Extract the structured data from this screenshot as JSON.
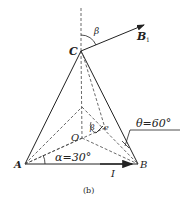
{
  "figure": {
    "caption": "(b)",
    "points": {
      "A": "A",
      "B": "B",
      "C": "C",
      "O": "O"
    },
    "vector_label": "B",
    "vector_subscript": "1",
    "current_label": "I",
    "angle_beta_top": "β",
    "angle_beta_inner": "β",
    "unit_e": "e",
    "alpha_label": "α=30°",
    "theta_label": "θ=60°"
  },
  "colors": {
    "line": "#222222",
    "background": "#ffffff"
  }
}
